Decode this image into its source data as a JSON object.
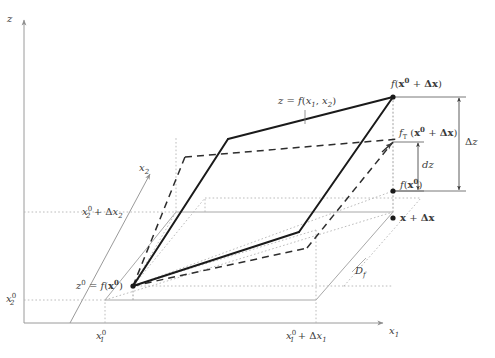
{
  "figure": {
    "type": "math-diagram"
  },
  "axes": {
    "z": {
      "label": "z"
    },
    "x1": {
      "label": "x",
      "sub": "1"
    },
    "x2": {
      "label": "x",
      "sub": "2"
    }
  },
  "ticks": {
    "x1_0": {
      "base": "x",
      "sub": "1",
      "sup": "0"
    },
    "x1_0_plus": {
      "text_base": "x",
      "sub": "1",
      "sup": "0",
      "plus": "+ Δx",
      "plus_sub": "1"
    },
    "x2_0": {
      "base": "x",
      "sub": "2",
      "sup": "0"
    },
    "x2_0_plus": {
      "base": "x",
      "sub": "2",
      "sup": "0",
      "plus": "+ Δx",
      "plus_sub": "2"
    }
  },
  "labels": {
    "surface": {
      "pre": "z = f(x",
      "sub1": "1",
      "mid": ", x",
      "sub2": "2",
      "post": ")"
    },
    "point_top": {
      "pre": "f(",
      "bold1": "x",
      "sup": "0",
      "plus": " + ",
      "bold2": "Δx",
      "post": ")"
    },
    "point_tangent": {
      "pre": "f",
      "subT": "T",
      "open": " (",
      "bold1": "x",
      "sup": "0",
      "plus": " + ",
      "bold2": "Δx",
      "post": ")"
    },
    "point_base_z": {
      "pre": "f(",
      "bold1": "x",
      "sup": "0",
      "post": ")"
    },
    "origin_z": {
      "zsym": "z",
      "sup": "0",
      "eq": " = f(",
      "bold1": "x",
      "sup2": "0",
      "post": ")"
    },
    "domain_point": {
      "bold1": "x",
      "plus": " + ",
      "bold2": "Δx"
    },
    "domain": {
      "base": "D",
      "sub": "f"
    },
    "delta_z": {
      "text": "Δz"
    },
    "dz": {
      "text": "dz"
    }
  },
  "colors": {
    "ink": "#3a3a3a",
    "surface_solid": "#1a1a1a",
    "tangent_dashed": "#2a2a2a",
    "axis_gray": "#9a9a9a",
    "guide_dotted": "#b0b0b0",
    "domain_gray": "#a8a8a8"
  },
  "geometry": {
    "origin": [
      70,
      323
    ],
    "x1_axis_end": [
      385,
      323
    ],
    "z_axis_top": [
      24,
      18
    ],
    "z_axis_base": [
      24,
      323
    ],
    "x2_axis_end": [
      152,
      172
    ],
    "point_f_x0": [
      133,
      286
    ],
    "point_f_x0_dx": [
      393,
      97
    ],
    "point_fT_x0_dx": [
      393,
      142
    ],
    "point_f_x0_right": [
      393,
      191
    ],
    "point_x_plus_dx": [
      393,
      218
    ]
  }
}
